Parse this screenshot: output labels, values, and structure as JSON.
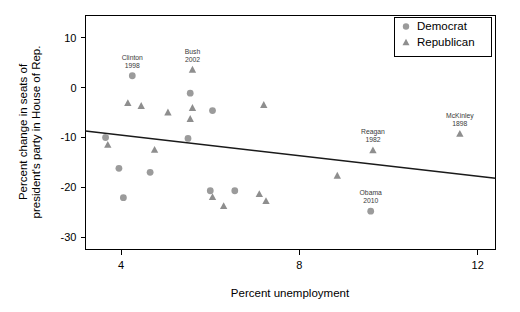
{
  "chart_data": {
    "type": "scatter",
    "title": "",
    "xlabel": "Percent unemployment",
    "ylabel": "Percent change in seats of president's party in House of Rep.",
    "xlim": [
      3.2,
      12.4
    ],
    "ylim": [
      -32.5,
      14.5
    ],
    "xticks": [
      4,
      8,
      12
    ],
    "xtick_labels": [
      "4",
      "8",
      "12"
    ],
    "yticks": [
      10,
      0,
      -10,
      -20,
      -30
    ],
    "ytick_labels": [
      "10",
      "0",
      "-10",
      "-20",
      "-30"
    ],
    "grid": false,
    "legend_position": "top-right",
    "legend": [
      {
        "name": "Democrat",
        "marker": "circle",
        "color": "#9b9b9b"
      },
      {
        "name": "Republican",
        "marker": "triangle",
        "color": "#8e8e8e"
      }
    ],
    "series": [
      {
        "name": "Democrat",
        "marker": "circle",
        "color": "#9b9b9b",
        "points": [
          {
            "x": 4.25,
            "y": 2.4,
            "label": "Clinton\n1998",
            "label_lines": [
              "Clinton",
              "1998"
            ]
          },
          {
            "x": 5.55,
            "y": -1.1,
            "label": "",
            "label_lines": []
          },
          {
            "x": 6.05,
            "y": -4.6,
            "label": "",
            "label_lines": []
          },
          {
            "x": 5.5,
            "y": -10.2,
            "label": "",
            "label_lines": []
          },
          {
            "x": 3.65,
            "y": -10.0,
            "label": "",
            "label_lines": []
          },
          {
            "x": 3.95,
            "y": -16.2,
            "label": "",
            "label_lines": []
          },
          {
            "x": 4.65,
            "y": -17.0,
            "label": "",
            "label_lines": []
          },
          {
            "x": 4.05,
            "y": -22.1,
            "label": "",
            "label_lines": []
          },
          {
            "x": 6.0,
            "y": -20.7,
            "label": "",
            "label_lines": []
          },
          {
            "x": 6.55,
            "y": -20.7,
            "label": "",
            "label_lines": []
          },
          {
            "x": 9.6,
            "y": -24.8,
            "label": "Obama\n2010",
            "label_lines": [
              "Obama",
              "2010"
            ]
          }
        ]
      },
      {
        "name": "Republican",
        "marker": "triangle",
        "color": "#8e8e8e",
        "points": [
          {
            "x": 5.6,
            "y": 3.6,
            "label": "Bush\n2002",
            "label_lines": [
              "Bush",
              "2002"
            ]
          },
          {
            "x": 4.15,
            "y": -3.1,
            "label": "",
            "label_lines": []
          },
          {
            "x": 4.45,
            "y": -3.7,
            "label": "",
            "label_lines": []
          },
          {
            "x": 5.05,
            "y": -5.0,
            "label": "",
            "label_lines": []
          },
          {
            "x": 5.6,
            "y": -4.1,
            "label": "",
            "label_lines": []
          },
          {
            "x": 7.2,
            "y": -3.5,
            "label": "",
            "label_lines": []
          },
          {
            "x": 5.55,
            "y": -6.3,
            "label": "",
            "label_lines": []
          },
          {
            "x": 3.7,
            "y": -11.5,
            "label": "",
            "label_lines": []
          },
          {
            "x": 4.75,
            "y": -12.5,
            "label": "",
            "label_lines": []
          },
          {
            "x": 6.05,
            "y": -22.0,
            "label": "",
            "label_lines": []
          },
          {
            "x": 6.3,
            "y": -23.8,
            "label": "",
            "label_lines": []
          },
          {
            "x": 7.1,
            "y": -21.4,
            "label": "",
            "label_lines": []
          },
          {
            "x": 7.25,
            "y": -22.8,
            "label": "",
            "label_lines": []
          },
          {
            "x": 8.85,
            "y": -17.7,
            "label": "",
            "label_lines": []
          },
          {
            "x": 9.65,
            "y": -12.6,
            "label": "Reagan\n1982",
            "label_lines": [
              "Reagan",
              "1982"
            ]
          },
          {
            "x": 11.6,
            "y": -9.3,
            "label": "McKinley\n1898",
            "label_lines": [
              "McKinley",
              "1898"
            ]
          }
        ]
      }
    ],
    "trend_line": {
      "name": "regression-line",
      "x0": 3.2,
      "y0": -8.7,
      "x1": 12.4,
      "y1": -18.2
    }
  }
}
